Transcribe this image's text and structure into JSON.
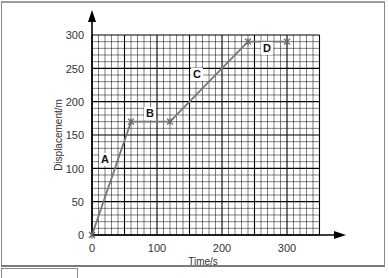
{
  "chart_data": {
    "type": "line",
    "title": "",
    "xlabel": "Time/s",
    "ylabel": "Displacement/m",
    "xlim": [
      0,
      350
    ],
    "ylim": [
      0,
      300
    ],
    "x_ticks": [
      0,
      100,
      200,
      300
    ],
    "y_ticks": [
      0,
      50,
      100,
      150,
      200,
      250,
      300
    ],
    "grid": true,
    "series": [
      {
        "name": "displacement",
        "x": [
          0,
          60,
          120,
          240,
          300
        ],
        "y": [
          0,
          170,
          170,
          290,
          290
        ]
      }
    ],
    "annotations": [
      {
        "label": "A",
        "x": 40,
        "y": 110,
        "segment": "0–60 s"
      },
      {
        "label": "B",
        "x": 90,
        "y": 180,
        "segment": "60–120 s"
      },
      {
        "label": "C",
        "x": 170,
        "y": 220,
        "segment": "120–240 s"
      },
      {
        "label": "D",
        "x": 270,
        "y": 280,
        "segment": "240–300 s"
      }
    ],
    "colors": {
      "line": "#777777",
      "grid": "#000000",
      "axis": "#000000"
    }
  },
  "labels": {
    "x_axis": "Time/s",
    "y_axis": "Displacement/m",
    "x_tick_0": "0",
    "x_tick_100": "100",
    "x_tick_200": "200",
    "x_tick_300": "300",
    "y_tick_0": "0",
    "y_tick_50": "50",
    "y_tick_100": "100",
    "y_tick_150": "150",
    "y_tick_200": "200",
    "y_tick_250": "250",
    "y_tick_300": "300",
    "seg_a": "A",
    "seg_b": "B",
    "seg_c": "C",
    "seg_d": "D"
  }
}
